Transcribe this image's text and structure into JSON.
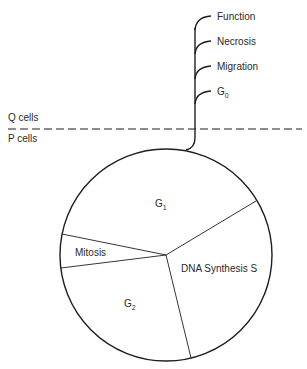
{
  "diagram": {
    "type": "cell-cycle",
    "quiescent_fates": [
      {
        "label": "Function",
        "subscript": ""
      },
      {
        "label": "Necrosis",
        "subscript": ""
      },
      {
        "label": "Migration",
        "subscript": ""
      },
      {
        "label": "G",
        "subscript": "0"
      }
    ],
    "boundary": {
      "upper_label": "Q cells",
      "lower_label": "P cells"
    },
    "phases": [
      {
        "id": "g1",
        "label": "G",
        "subscript": "1"
      },
      {
        "id": "s",
        "label": "DNA Synthesis S",
        "subscript": ""
      },
      {
        "id": "g2",
        "label": "G",
        "subscript": "2"
      },
      {
        "id": "m",
        "label": "Mitosis",
        "subscript": ""
      }
    ],
    "direction": "clockwise",
    "colors": {
      "line": "#1e1e1e",
      "text": "#2a2a2a",
      "background": "#ffffff"
    }
  }
}
